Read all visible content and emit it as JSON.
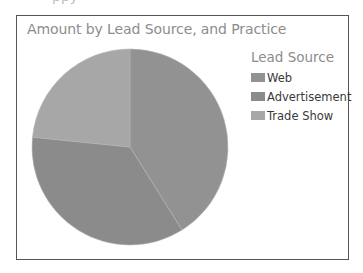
{
  "chart_data": {
    "type": "pie",
    "title": "Amount by Lead Source, and Practice",
    "legend_title": "Lead Source",
    "legend_position": "right",
    "categories": [
      "Web",
      "Advertisement",
      "Trade Show"
    ],
    "values": [
      41.1,
      35.5,
      23.4
    ],
    "value_unit": "percent (estimated from slice angles)",
    "start_angle_deg": 0,
    "direction": "clockwise",
    "colors": [
      "#929292",
      "#8b8b8b",
      "#a7a7a7"
    ]
  },
  "cutoff_text": "ppy",
  "chart": {
    "title": "Amount by Lead Source, and Practice",
    "legend": {
      "title": "Lead Source",
      "items": [
        {
          "label": "Web",
          "color": "#929292"
        },
        {
          "label": "Advertisement",
          "color": "#8b8b8b"
        },
        {
          "label": "Trade Show",
          "color": "#a7a7a7"
        }
      ]
    }
  }
}
